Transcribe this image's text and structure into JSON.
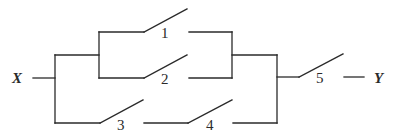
{
  "diagram": {
    "type": "switching-circuit",
    "input_label": "X",
    "output_label": "Y",
    "switches": [
      {
        "id": "1",
        "label": "1",
        "branch": "upper-parallel-top"
      },
      {
        "id": "2",
        "label": "2",
        "branch": "upper-parallel-bottom"
      },
      {
        "id": "3",
        "label": "3",
        "branch": "lower-series-first"
      },
      {
        "id": "4",
        "label": "4",
        "branch": "lower-series-second"
      },
      {
        "id": "5",
        "label": "5",
        "branch": "output-series"
      }
    ],
    "topology": "((1 || 2) || (3 -> 4)) -> 5",
    "line_color": "#2a2a2a",
    "background": "#ffffff"
  }
}
